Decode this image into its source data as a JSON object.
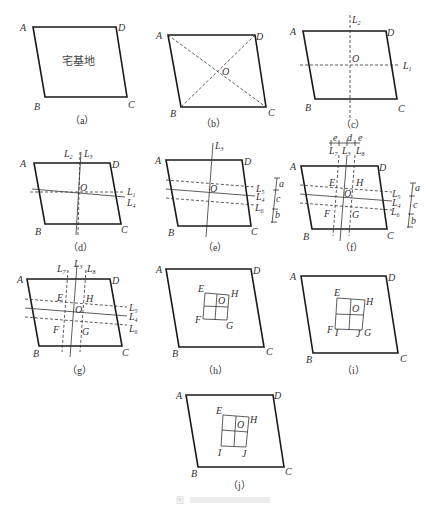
{
  "figure": {
    "caption": "图",
    "panels": [
      {
        "id": "a",
        "label": "（a）",
        "center_text": "宅基地",
        "vertices": [
          "A",
          "B",
          "C",
          "D"
        ]
      },
      {
        "id": "b",
        "label": "（b）",
        "vertices": [
          "A",
          "B",
          "C",
          "D"
        ],
        "points": [
          "O"
        ]
      },
      {
        "id": "c",
        "label": "（c）",
        "vertices": [
          "A",
          "B",
          "C",
          "D"
        ],
        "points": [
          "O"
        ],
        "lines": [
          "L2",
          "L1"
        ]
      },
      {
        "id": "d",
        "label": "（d）",
        "vertices": [
          "A",
          "B",
          "C",
          "D"
        ],
        "points": [
          "O"
        ],
        "lines": [
          "L2",
          "L3",
          "L1",
          "L4"
        ]
      },
      {
        "id": "e",
        "label": "（e）",
        "vertices": [
          "A",
          "B",
          "C",
          "D"
        ],
        "points": [
          "O"
        ],
        "lines": [
          "L3",
          "L5",
          "L4",
          "L6"
        ],
        "dimensions": [
          "a",
          "c",
          "b"
        ]
      },
      {
        "id": "f",
        "label": "（f）",
        "vertices": [
          "A",
          "B",
          "C",
          "D"
        ],
        "points": [
          "O",
          "E",
          "H",
          "F",
          "G"
        ],
        "lines": [
          "L7",
          "L3",
          "L8",
          "L5",
          "L4",
          "L6"
        ],
        "dimensions": [
          "e",
          "d",
          "e",
          "a",
          "c",
          "b"
        ]
      },
      {
        "id": "g",
        "label": "（g）",
        "vertices": [
          "A",
          "B",
          "C",
          "D"
        ],
        "points": [
          "O",
          "E",
          "H",
          "F",
          "G"
        ],
        "lines": [
          "L7",
          "L3",
          "L8",
          "L5",
          "L4",
          "L6"
        ]
      },
      {
        "id": "h",
        "label": "（h）",
        "vertices": [
          "A",
          "B",
          "C",
          "D"
        ],
        "points": [
          "E",
          "H",
          "O",
          "F",
          "G"
        ]
      },
      {
        "id": "i",
        "label": "（i）",
        "vertices": [
          "A",
          "B",
          "C",
          "D"
        ],
        "points": [
          "E",
          "H",
          "O",
          "F",
          "I",
          "J",
          "G"
        ]
      },
      {
        "id": "j",
        "label": "（j）",
        "vertices": [
          "A",
          "B",
          "C",
          "D"
        ],
        "points": [
          "E",
          "H",
          "O",
          "I",
          "J"
        ]
      }
    ]
  },
  "labels": {
    "A": "A",
    "B": "B",
    "C": "C",
    "D": "D",
    "O": "O",
    "E": "E",
    "F": "F",
    "G": "G",
    "H": "H",
    "I": "I",
    "J": "J",
    "L": "L",
    "s1": "1",
    "s2": "2",
    "s3": "3",
    "s4": "4",
    "s5": "5",
    "s6": "6",
    "s7": "7",
    "s8": "8",
    "a": "a",
    "b": "b",
    "c": "c",
    "d": "d",
    "e": "e"
  }
}
